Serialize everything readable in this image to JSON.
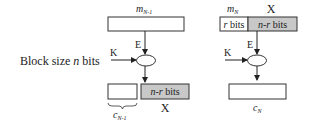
{
  "diagram": {
    "side_label": {
      "prefix": "Block size ",
      "var": "n",
      "suffix": " bits"
    },
    "colors": {
      "stroke": "#333333",
      "gray_fill": "#c8c8c8",
      "white_fill": "#ffffff"
    },
    "left": {
      "top_label": {
        "base": "m",
        "sub": "N-1"
      },
      "key_label": "K",
      "enc_label": "E",
      "out_gray_box_label": {
        "var": "n-r",
        "suffix": " bits"
      },
      "out_gray_caption": "X",
      "out_white_caption": {
        "base": "c",
        "sub": "N-1"
      }
    },
    "right": {
      "top_label": {
        "base": "m",
        "sub": "N"
      },
      "top_x_label": "X",
      "top_left_segment": {
        "var": "r",
        "suffix": " bits"
      },
      "top_right_segment": {
        "var": "n-r",
        "suffix": " bits"
      },
      "key_label": "K",
      "enc_label": "E",
      "out_caption": {
        "base": "c",
        "sub": "N"
      }
    }
  }
}
